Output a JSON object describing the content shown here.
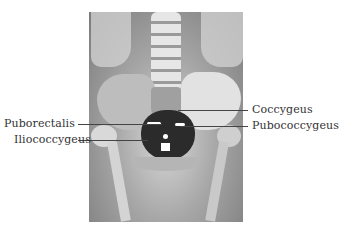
{
  "figure": {
    "labels": {
      "puborectalis": "Puborectalis",
      "iliococcygeus": "Iliococcygeus",
      "coccygeus": "Coccygeus",
      "pubococcygeus": "Pubococcygeus"
    }
  }
}
